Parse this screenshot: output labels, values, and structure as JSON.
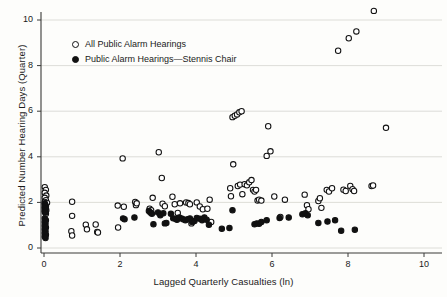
{
  "chart_data": {
    "type": "scatter",
    "title": "",
    "xlabel": "Lagged Quarterly Casualties (ln)",
    "ylabel": "Predicted Number Hearing Days (Quarter)",
    "xlim": [
      -0.35,
      10.6
    ],
    "ylim": [
      -0.45,
      10.9
    ],
    "xticks": [
      0,
      2,
      4,
      6,
      8,
      10
    ],
    "xtick_labels": [
      "0",
      "2",
      "4",
      "6",
      "8",
      "10"
    ],
    "yticks": [
      0,
      2,
      4,
      6,
      8,
      10
    ],
    "ytick_labels": [
      "0",
      "2",
      "4",
      "6",
      "8",
      "10"
    ],
    "grid": "horizontal",
    "grid_color": "#d9d9d4",
    "legend_position": "upper-left",
    "marker_colors": {
      "open": "#111111",
      "filled": "#111111",
      "background": "#ffffff"
    },
    "series": [
      {
        "name": "All Public Alarm Hearings",
        "marker": "open-circle",
        "points": [
          [
            0.02,
            2.67
          ],
          [
            0.05,
            2.55
          ],
          [
            0.02,
            2.42
          ],
          [
            0.06,
            2.3
          ],
          [
            0.02,
            2.2
          ],
          [
            0.05,
            2.1
          ],
          [
            0.02,
            2.02
          ],
          [
            0.08,
            1.98
          ],
          [
            0.02,
            1.9
          ],
          [
            0.05,
            1.82
          ],
          [
            0.02,
            1.74
          ],
          [
            0.06,
            1.66
          ],
          [
            0.02,
            1.58
          ],
          [
            0.05,
            1.5
          ],
          [
            0.74,
            2.03
          ],
          [
            0.74,
            1.41
          ],
          [
            0.72,
            0.74
          ],
          [
            0.74,
            0.55
          ],
          [
            1.1,
            1.02
          ],
          [
            1.13,
            0.82
          ],
          [
            1.36,
            1.03
          ],
          [
            1.4,
            0.7
          ],
          [
            1.42,
            0.68
          ],
          [
            1.94,
            1.86
          ],
          [
            1.95,
            0.9
          ],
          [
            2.07,
            3.93
          ],
          [
            2.1,
            1.81
          ],
          [
            2.4,
            2.02
          ],
          [
            2.42,
            1.88
          ],
          [
            2.44,
            1.96
          ],
          [
            2.78,
            1.72
          ],
          [
            2.82,
            1.66
          ],
          [
            2.86,
            2.2
          ],
          [
            3.02,
            4.2
          ],
          [
            3.1,
            3.07
          ],
          [
            3.12,
            1.94
          ],
          [
            3.18,
            1.83
          ],
          [
            3.38,
            2.25
          ],
          [
            3.44,
            1.92
          ],
          [
            3.52,
            1.54
          ],
          [
            3.58,
            1.96
          ],
          [
            3.74,
            2.0
          ],
          [
            3.8,
            1.97
          ],
          [
            3.84,
            1.92
          ],
          [
            3.88,
            1.08
          ],
          [
            4.02,
            2.0
          ],
          [
            4.1,
            1.82
          ],
          [
            4.18,
            1.7
          ],
          [
            4.3,
            1.72
          ],
          [
            4.36,
            2.12
          ],
          [
            4.4,
            1.14
          ],
          [
            4.9,
            2.62
          ],
          [
            4.92,
            2.27
          ],
          [
            4.96,
            5.74
          ],
          [
            4.98,
            3.67
          ],
          [
            5.02,
            5.8
          ],
          [
            5.08,
            5.86
          ],
          [
            5.14,
            5.95
          ],
          [
            5.2,
            6.0
          ],
          [
            5.1,
            2.72
          ],
          [
            5.16,
            2.78
          ],
          [
            5.22,
            2.36
          ],
          [
            5.28,
            2.8
          ],
          [
            5.34,
            2.75
          ],
          [
            5.4,
            2.88
          ],
          [
            5.46,
            2.98
          ],
          [
            5.5,
            2.55
          ],
          [
            5.54,
            2.48
          ],
          [
            5.58,
            2.55
          ],
          [
            5.62,
            2.08
          ],
          [
            5.66,
            2.12
          ],
          [
            5.72,
            2.08
          ],
          [
            5.86,
            4.04
          ],
          [
            5.9,
            5.34
          ],
          [
            5.96,
            4.24
          ],
          [
            6.06,
            2.26
          ],
          [
            6.22,
            1.36
          ],
          [
            6.34,
            2.12
          ],
          [
            6.86,
            2.34
          ],
          [
            6.92,
            1.88
          ],
          [
            6.96,
            1.7
          ],
          [
            7.22,
            2.06
          ],
          [
            7.26,
            2.18
          ],
          [
            7.3,
            1.76
          ],
          [
            7.44,
            2.55
          ],
          [
            7.5,
            2.48
          ],
          [
            7.58,
            2.62
          ],
          [
            7.74,
            8.65
          ],
          [
            7.88,
            2.56
          ],
          [
            7.94,
            2.5
          ],
          [
            8.02,
            9.2
          ],
          [
            8.06,
            2.72
          ],
          [
            8.12,
            2.58
          ],
          [
            8.16,
            2.5
          ],
          [
            8.22,
            9.5
          ],
          [
            8.62,
            2.72
          ],
          [
            8.66,
            2.74
          ],
          [
            8.68,
            10.4
          ],
          [
            9.0,
            5.27
          ]
        ]
      },
      {
        "name": "Public Alarm Hearings—Stennis Chair",
        "marker": "filled-circle",
        "points": [
          [
            0.02,
            1.96
          ],
          [
            0.04,
            1.88
          ],
          [
            0.02,
            1.8
          ],
          [
            0.05,
            1.72
          ],
          [
            0.02,
            1.64
          ],
          [
            0.04,
            1.56
          ],
          [
            0.02,
            1.3
          ],
          [
            0.05,
            1.22
          ],
          [
            0.02,
            1.14
          ],
          [
            0.04,
            1.06
          ],
          [
            0.02,
            0.98
          ],
          [
            0.05,
            0.9
          ],
          [
            0.02,
            0.82
          ],
          [
            0.04,
            0.74
          ],
          [
            0.02,
            0.66
          ],
          [
            0.05,
            0.58
          ],
          [
            0.02,
            0.5
          ],
          [
            0.04,
            0.44
          ],
          [
            2.08,
            1.3
          ],
          [
            2.12,
            1.26
          ],
          [
            2.38,
            1.34
          ],
          [
            2.76,
            1.62
          ],
          [
            2.8,
            1.56
          ],
          [
            2.84,
            1.5
          ],
          [
            2.88,
            1.04
          ],
          [
            3.0,
            1.56
          ],
          [
            3.06,
            1.44
          ],
          [
            3.14,
            1.52
          ],
          [
            3.18,
            1.08
          ],
          [
            3.22,
            1.1
          ],
          [
            3.34,
            1.5
          ],
          [
            3.4,
            1.3
          ],
          [
            3.46,
            1.28
          ],
          [
            3.5,
            1.24
          ],
          [
            3.56,
            1.34
          ],
          [
            3.62,
            1.3
          ],
          [
            3.66,
            1.26
          ],
          [
            3.72,
            1.22
          ],
          [
            3.78,
            1.26
          ],
          [
            3.84,
            1.3
          ],
          [
            3.9,
            1.14
          ],
          [
            3.96,
            1.18
          ],
          [
            4.02,
            1.32
          ],
          [
            4.1,
            1.28
          ],
          [
            4.16,
            1.22
          ],
          [
            4.22,
            1.34
          ],
          [
            4.28,
            1.24
          ],
          [
            4.34,
            1.02
          ],
          [
            4.68,
            0.84
          ],
          [
            4.88,
            0.88
          ],
          [
            4.96,
            1.66
          ],
          [
            5.54,
            1.04
          ],
          [
            5.6,
            1.08
          ],
          [
            5.66,
            1.06
          ],
          [
            5.72,
            1.14
          ],
          [
            5.86,
            1.22
          ],
          [
            6.2,
            1.32
          ],
          [
            6.44,
            1.34
          ],
          [
            6.8,
            1.48
          ],
          [
            6.88,
            1.52
          ],
          [
            6.94,
            1.44
          ],
          [
            7.22,
            1.1
          ],
          [
            7.46,
            1.16
          ],
          [
            7.66,
            1.22
          ],
          [
            7.82,
            0.76
          ],
          [
            8.18,
            0.8
          ]
        ]
      }
    ]
  },
  "legend": {
    "items": [
      {
        "label": "All Public Alarm Hearings",
        "marker": "open"
      },
      {
        "label": "Public Alarm Hearings—Stennis Chair",
        "marker": "filled"
      }
    ]
  }
}
